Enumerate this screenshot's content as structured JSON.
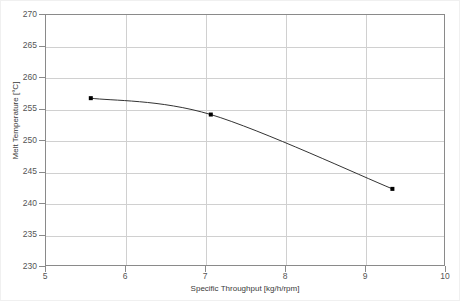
{
  "chart_data": {
    "type": "line",
    "title": "",
    "xlabel": "Specific Throughput [kg/h/rpm]",
    "ylabel": "Melt Temperature [°C]",
    "xlim": [
      5,
      10
    ],
    "ylim": [
      230,
      270
    ],
    "xticks": [
      5,
      6,
      7,
      8,
      9,
      10
    ],
    "yticks": [
      230,
      235,
      240,
      245,
      250,
      255,
      260,
      265,
      270
    ],
    "xtick_labels": [
      "5",
      "6",
      "7",
      "8",
      "9",
      "10"
    ],
    "ytick_labels": [
      "230",
      "235",
      "240",
      "245",
      "250",
      "255",
      "260",
      "265",
      "270"
    ],
    "grid": true,
    "legend": false,
    "markers": "square",
    "line_style": "smooth-spline",
    "line_color": "#333333",
    "marker_color": "#000000",
    "grid_color": "#d0d0d0",
    "axis_color": "#8a8a8a",
    "series": [
      {
        "name": "Melt Temperature",
        "x": [
          5.56,
          7.06,
          9.33
        ],
        "y": [
          256.8,
          254.2,
          242.4
        ]
      }
    ]
  }
}
